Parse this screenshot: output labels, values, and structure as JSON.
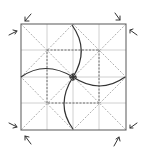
{
  "diagram": {
    "type": "origami-fold-diagram",
    "square": {
      "x": 21,
      "y": 24,
      "size": 105
    },
    "colors": {
      "edge": "#555555",
      "grid": "#bbbbbb",
      "valley": "#666666",
      "diagonal": "#999999",
      "curve": "#333333",
      "arrow": "#333333"
    },
    "arrows": [
      {
        "name": "arrow-top-left-down",
        "dir": "down"
      },
      {
        "name": "arrow-top-left-right",
        "dir": "right"
      },
      {
        "name": "arrow-top-right-down",
        "dir": "down"
      },
      {
        "name": "arrow-top-right-left",
        "dir": "left"
      },
      {
        "name": "arrow-bottom-left-right",
        "dir": "right"
      },
      {
        "name": "arrow-bottom-left-up",
        "dir": "up"
      },
      {
        "name": "arrow-bottom-right-left",
        "dir": "left"
      },
      {
        "name": "arrow-bottom-right-up",
        "dir": "up"
      }
    ]
  }
}
